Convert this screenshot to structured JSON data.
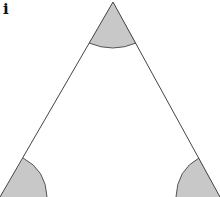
{
  "figure": {
    "label": "i",
    "shape": "triangle",
    "angles_marked": [
      "apex",
      "bottom-left",
      "bottom-right"
    ],
    "colors": {
      "line": "#444444",
      "fill": "#c8c8c8",
      "background": "#ffffff"
    }
  }
}
